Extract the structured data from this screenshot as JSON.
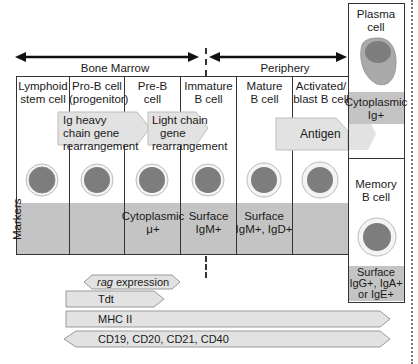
{
  "regions": {
    "bone_marrow": "Bone Marrow",
    "periphery": "Periphery"
  },
  "stages": [
    {
      "id": "lymphoid-stem-cell",
      "label_line1": "Lymphoid",
      "label_line2": "stem cell",
      "marker_line1": "",
      "marker_line2": ""
    },
    {
      "id": "pro-b-cell",
      "label_line1": "Pro-B cell",
      "label_line2": "(progenitor)",
      "marker_line1": "",
      "marker_line2": ""
    },
    {
      "id": "pre-b-cell",
      "label_line1": "Pre-B",
      "label_line2": "cell",
      "marker_line1": "Cytoplasmic",
      "marker_line2": "μ+"
    },
    {
      "id": "immature-b-cell",
      "label_line1": "Immature",
      "label_line2": "B cell",
      "marker_line1": "Surface",
      "marker_line2": "IgM+"
    },
    {
      "id": "mature-b-cell",
      "label_line1": "Mature",
      "label_line2": "B cell",
      "marker_line1": "Surface",
      "marker_line2": "IgM+, IgD+"
    },
    {
      "id": "activated-blast-b-cell",
      "label_line1": "Activated/",
      "label_line2": "blast B cell",
      "marker_line1": "",
      "marker_line2": ""
    }
  ],
  "plasma_cell": {
    "label_line1": "Plasma",
    "label_line2": "cell",
    "marker_line1": "Cytoplasmic",
    "marker_line2": "Ig+"
  },
  "memory_b_cell": {
    "label_line1": "Memory",
    "label_line2": "B cell",
    "marker_line1": "Surface",
    "marker_line2": "IgG+, IgA+",
    "marker_line3": "or IgE+"
  },
  "markers_row_label": "Markers",
  "processes": {
    "ig_heavy": {
      "line1": "Ig heavy",
      "line2": "chain gene",
      "line3": "rearrangement"
    },
    "light_chain": {
      "line1": "Light chain",
      "line2": "gene",
      "line3": "rearrangement"
    },
    "antigen": "Antigen"
  },
  "expression_bars": [
    {
      "id": "rag",
      "label_italic": "rag",
      "label_rest": " expression"
    },
    {
      "id": "tdt",
      "label": "Tdt"
    },
    {
      "id": "mhc2",
      "label": "MHC II"
    },
    {
      "id": "cd",
      "label": "CD19, CD20, CD21, CD40"
    }
  ],
  "colors": {
    "band_gray": "#c4c4c4",
    "arrow_fill": "#e2e2e2",
    "cell_nucleus": "#7a7a7a",
    "plasma_cytoplasm": "#a9a9a9",
    "line": "#333333"
  }
}
